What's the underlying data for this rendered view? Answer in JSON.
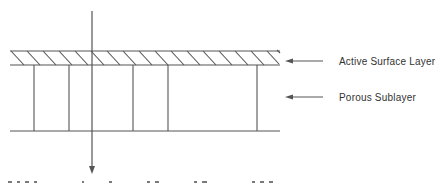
{
  "diagram": {
    "labels": {
      "active_surface_layer": "Active Surface Layer",
      "porous_sublayer": "Porous Sublayer"
    },
    "colors": {
      "line": "#555555",
      "text": "#333333",
      "background": "#ffffff"
    },
    "layers": [
      {
        "name": "active-surface-layer",
        "pattern": "diagonal-hatch",
        "top_y": 51,
        "bottom_y": 65
      },
      {
        "name": "porous-sublayer",
        "pattern": "vertical-pores",
        "top_y": 65,
        "bottom_y": 131
      }
    ],
    "pore_positions_x": [
      34,
      69,
      133,
      168,
      257
    ],
    "flow_arrow": {
      "direction": "down",
      "x": 92
    }
  }
}
